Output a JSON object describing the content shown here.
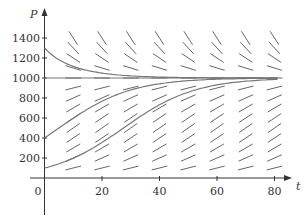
{
  "chart_data": {
    "type": "line",
    "xlabel": "t",
    "ylabel": "P",
    "xlim": [
      0,
      85
    ],
    "ylim": [
      0,
      1500
    ],
    "x_ticks": [
      0,
      20,
      40,
      60,
      80
    ],
    "y_ticks": [
      200,
      400,
      600,
      800,
      1000,
      1200,
      1400
    ],
    "carrying_capacity": 1000,
    "growth_rate": 0.08,
    "series": [
      {
        "name": "P0=1300",
        "initial": 1300
      },
      {
        "name": "P0=400",
        "initial": 400
      },
      {
        "name": "P0=100",
        "initial": 100
      },
      {
        "name": "equilibrium",
        "initial": 1000
      }
    ]
  }
}
